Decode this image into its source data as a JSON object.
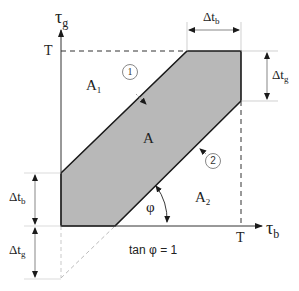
{
  "diagram": {
    "axes": {
      "y_axis": {
        "symbol": "τ",
        "subscript": "g"
      },
      "x_axis": {
        "symbol": "τ",
        "subscript": "b"
      },
      "y_limit_label": "T",
      "x_limit_label": "T"
    },
    "regions": {
      "a1": {
        "symbol": "A",
        "subscript": "1"
      },
      "a": {
        "symbol": "A"
      },
      "a2": {
        "symbol": "A",
        "subscript": "2"
      }
    },
    "boundary_markers": {
      "line1": "1",
      "line2": "2"
    },
    "angle_label": "φ",
    "dimensions": {
      "top": {
        "symbol": "Δt",
        "subscript": "b"
      },
      "right": {
        "symbol": "Δt",
        "subscript": "g"
      },
      "left_upper": {
        "symbol": "Δt",
        "subscript": "b"
      },
      "left_lower": {
        "symbol": "Δt",
        "subscript": "g"
      }
    },
    "equation": "tan φ = 1",
    "colors": {
      "fill": "#b8b8b8",
      "line": "#1a1a1a",
      "guide": "#999999"
    }
  }
}
